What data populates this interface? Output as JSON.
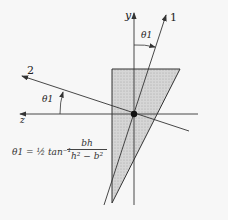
{
  "diagram": {
    "type": "principal-axes-of-triangular-section",
    "axes": {
      "y_label": "y",
      "z_label": "z",
      "axis1_label": "1",
      "axis2_label": "2"
    },
    "angles": {
      "upper_label": "θ1",
      "left_label": "θ1"
    },
    "formula": {
      "lhs": "θ1 = ½ tan⁻¹",
      "numerator": "bh",
      "denominator": "h² − b²"
    },
    "colors": {
      "fill": "#cfcfcf",
      "stroke": "#333333",
      "background": "#f7f7f7"
    }
  }
}
